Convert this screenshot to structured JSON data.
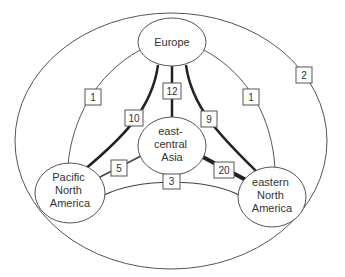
{
  "diagram": {
    "type": "flow-network",
    "colors": {
      "stroke": "#555555",
      "text": "#333333",
      "background": "#ffffff"
    },
    "outer_region": {
      "label": "2"
    },
    "nodes": [
      {
        "id": "europe",
        "lines": [
          "Europe"
        ]
      },
      {
        "id": "asia",
        "lines": [
          "east-",
          "central",
          "Asia"
        ]
      },
      {
        "id": "pna",
        "lines": [
          "Pacific",
          "North",
          "America"
        ]
      },
      {
        "id": "ena",
        "lines": [
          "eastern",
          "North",
          "America"
        ]
      }
    ],
    "edges": [
      {
        "id": "europe-pna-outer",
        "from": "Europe",
        "to": "Pacific North America",
        "label": "1"
      },
      {
        "id": "europe-ena-outer",
        "from": "Europe",
        "to": "eastern North America",
        "label": "1"
      },
      {
        "id": "europe-pna-inner",
        "from": "Europe",
        "to": "Pacific North America",
        "label": "10"
      },
      {
        "id": "europe-asia",
        "from": "Europe",
        "to": "east-central Asia",
        "label": "12"
      },
      {
        "id": "europe-ena-inner",
        "from": "Europe",
        "to": "eastern North America",
        "label": "9"
      },
      {
        "id": "asia-pna",
        "from": "east-central Asia",
        "to": "Pacific North America",
        "label": "5"
      },
      {
        "id": "asia-ena",
        "from": "east-central Asia",
        "to": "eastern North America",
        "label": "20"
      },
      {
        "id": "pna-ena",
        "from": "Pacific North America",
        "to": "eastern North America",
        "label": "3"
      }
    ]
  }
}
